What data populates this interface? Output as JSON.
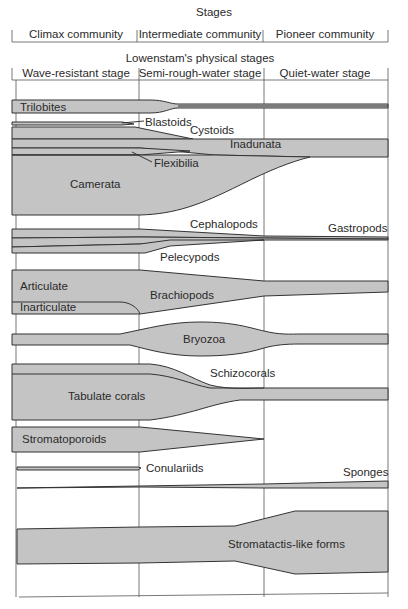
{
  "header": {
    "stages_title": "Stages",
    "stages": [
      "Climax community",
      "Intermediate community",
      "Pioneer community"
    ],
    "physical_title": "Lowenstam's physical stages",
    "physical_stages": [
      "Wave-resistant stage",
      "Semi-rough-water stage",
      "Quiet-water stage"
    ]
  },
  "colors": {
    "band_fill": "#c4c4c4",
    "line": "#333333",
    "background": "#ffffff"
  },
  "taxa": {
    "trilobites": "Trilobites",
    "blastoids": "Blastoids",
    "cystoids": "Cystoids",
    "inadunata": "Inadunata",
    "flexibilia": "Flexibilia",
    "camerata": "Camerata",
    "cephalopods": "Cephalopods",
    "gastropods": "Gastropods",
    "pelecypods": "Pelecypods",
    "articulate": "Articulate",
    "inarticulate": "Inarticulate",
    "brachiopods": "Brachiopods",
    "bryozoa": "Bryozoa",
    "schizocorals": "Schizocorals",
    "tabulate_corals": "Tabulate corals",
    "stromatoporoids": "Stromatoporoids",
    "conulariids": "Conulariids",
    "sponges": "Sponges",
    "stromatactis": "Stromatactis-like forms"
  }
}
